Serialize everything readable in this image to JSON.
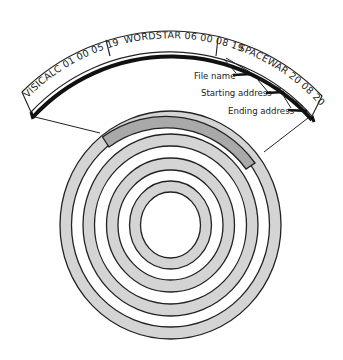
{
  "diagram": {
    "type": "disk-directory-track",
    "directory_entries": [
      {
        "name": "VISICALC",
        "start": "01 00",
        "end": "05 19",
        "label": "VISICALC 01 00 05 19"
      },
      {
        "name": "WORDSTAR",
        "start": "06 00",
        "end": "08 19",
        "label": "WORDSTAR 06 00 08 19"
      },
      {
        "name": "SPACEWAR",
        "start": "20 08",
        "end": "20 09",
        "label": "SPACEWAR  20 08  20 09"
      }
    ],
    "callouts": [
      {
        "label": "File name"
      },
      {
        "label": "Starting address"
      },
      {
        "label": "Ending address"
      }
    ],
    "disk": {
      "track_count": 4,
      "highlighted_track": "outermost",
      "colors": {
        "track_fill": "#d4d4d4",
        "highlight_fill": "#a9a9a9",
        "outline": "#222222"
      }
    }
  }
}
